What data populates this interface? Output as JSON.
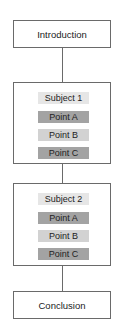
{
  "diagram": {
    "intro": "Introduction",
    "conclusion": "Conclusion",
    "subjects": [
      {
        "title": "Subject 1",
        "points": [
          {
            "label": "Point A",
            "shade": "dark"
          },
          {
            "label": "Point B",
            "shade": "light"
          },
          {
            "label": "Point C",
            "shade": "dark"
          }
        ]
      },
      {
        "title": "Subject 2",
        "points": [
          {
            "label": "Point A",
            "shade": "dark"
          },
          {
            "label": "Point B",
            "shade": "light"
          },
          {
            "label": "Point C",
            "shade": "dark"
          }
        ]
      }
    ],
    "colors": {
      "border": "#6a6a6a",
      "subject_bg": "#e6e6e6",
      "dark_point": "#a3a3a3",
      "light_point": "#d2d2d2"
    }
  }
}
